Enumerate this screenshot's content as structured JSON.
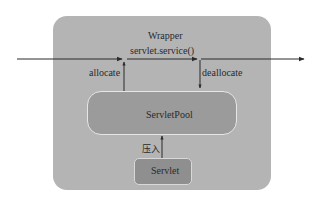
{
  "diagram": {
    "wrapper": {
      "label": "Wrapper"
    },
    "main_flow": {
      "label": "servlet.service()"
    },
    "allocate": {
      "label": "allocate"
    },
    "deallocate": {
      "label": "deallocate"
    },
    "pool": {
      "label": "ServletPool"
    },
    "push": {
      "label": "压入"
    },
    "servlet": {
      "label": "Servlet"
    }
  },
  "colors": {
    "wrapper_fill": "#b4b4b4",
    "pool_fill": "#9b9b9b",
    "servlet_fill": "#8f8f8f",
    "line": "#2a2a2a"
  }
}
